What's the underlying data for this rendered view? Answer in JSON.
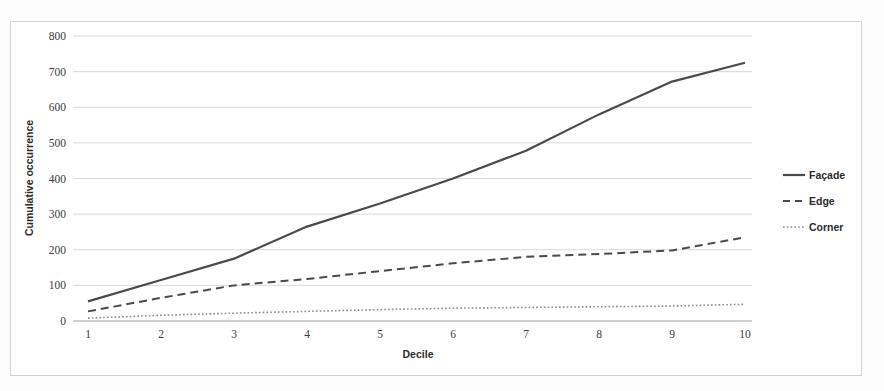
{
  "figure": {
    "background_color": "#ffffff",
    "frame_color": "#d2d2d2",
    "line_color": "#4a4a4a",
    "grid_color": "#d9d9d9"
  },
  "chart_data": {
    "type": "line",
    "title": "",
    "xlabel": "Decile",
    "ylabel": "Cumulative occurrence",
    "categories": [
      "1",
      "2",
      "3",
      "4",
      "5",
      "6",
      "7",
      "8",
      "9",
      "10"
    ],
    "x": [
      1,
      2,
      3,
      4,
      5,
      6,
      7,
      8,
      9,
      10
    ],
    "xlim": [
      1,
      10
    ],
    "ylim": [
      0,
      800
    ],
    "yticks": [
      0,
      100,
      200,
      300,
      400,
      500,
      600,
      700,
      800
    ],
    "ytick_labels": [
      "0",
      "100",
      "200",
      "300",
      "400",
      "500",
      "600",
      "700",
      "800"
    ],
    "xtick_labels": [
      "1",
      "2",
      "3",
      "4",
      "5",
      "6",
      "7",
      "8",
      "9",
      "10"
    ],
    "grid": "horizontal",
    "legend_position": "right",
    "series": [
      {
        "name": "Façade",
        "style": "solid",
        "color": "#4a4a4a",
        "values": [
          55,
          115,
          175,
          265,
          330,
          400,
          478,
          580,
          672,
          725
        ]
      },
      {
        "name": "Edge",
        "style": "dashed",
        "color": "#4a4a4a",
        "values": [
          27,
          65,
          100,
          118,
          140,
          162,
          180,
          188,
          198,
          235
        ]
      },
      {
        "name": "Corner",
        "style": "dotted",
        "color": "#8a8a8a",
        "values": [
          8,
          16,
          22,
          27,
          32,
          36,
          38,
          40,
          42,
          47
        ]
      }
    ]
  },
  "legend": {
    "items": [
      {
        "label": "Façade",
        "style": "solid"
      },
      {
        "label": "Edge",
        "style": "dashed"
      },
      {
        "label": "Corner",
        "style": "dotted"
      }
    ]
  }
}
